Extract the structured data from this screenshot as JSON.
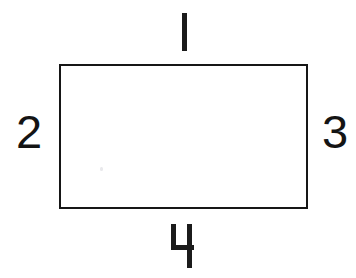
{
  "figure": {
    "type": "rectangle-diagram",
    "background_color": "#ffffff",
    "stroke_color": "#161616",
    "label_color": "#141414",
    "shape": {
      "name": "rectangle",
      "x": 59,
      "y": 64,
      "width": 249,
      "height": 145,
      "border_width": 2,
      "fill": "#ffffff"
    },
    "labels": [
      {
        "id": "top",
        "text": "1",
        "side": "top",
        "x": 182,
        "y": 31
      },
      {
        "id": "left",
        "text": "2",
        "side": "left",
        "x": 27,
        "y": 137
      },
      {
        "id": "right",
        "text": "3",
        "side": "right",
        "x": 335,
        "y": 137
      },
      {
        "id": "bottom",
        "text": "4",
        "side": "bottom",
        "x": 182,
        "y": 246
      }
    ]
  }
}
